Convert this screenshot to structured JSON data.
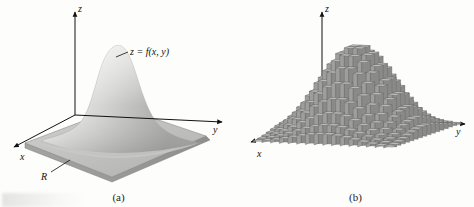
{
  "figure": {
    "background": "#fdfdfc",
    "ink": "#111111"
  },
  "panels": [
    {
      "id": "a",
      "caption": "(a)",
      "axes": {
        "x_label": "x",
        "y_label": "y",
        "z_label": "z"
      },
      "annotations": {
        "surface_label": "z = f(x, y)",
        "region_label": "R"
      },
      "surface": {
        "kind": "smooth-bell",
        "fill_light": "#f2f2f1",
        "fill_mid": "#c9c9c7",
        "fill_dark": "#a2a2a0"
      },
      "region": {
        "fill_top": "#c2c2c0",
        "fill_side": "#9d9d9b",
        "edge": "#7d7d7b"
      }
    },
    {
      "id": "b",
      "caption": "(b)",
      "axes": {
        "x_label": "x",
        "y_label": "y",
        "z_label": "z"
      },
      "surface": {
        "kind": "riemann-prisms",
        "column_face": "#9e9e9c",
        "column_side": "#8a8a88",
        "column_top": "#c4c4c2",
        "edge": "#5f5f5d"
      }
    }
  ],
  "chart_data": {
    "type": "surface",
    "title": "",
    "xlabel": "x",
    "ylabel": "y",
    "zlabel": "z",
    "description_a": "Smooth surface z = f(x, y) over rectangular region R in the xy-plane",
    "description_b": "Riemann sum approximation of the same surface by rectangular prisms over a grid partition of R",
    "function": "bell / gaussian-like peak centered on region R",
    "grid_nx": 16,
    "grid_ny": 16,
    "peak_height": 1.0,
    "x_range": [
      -2,
      2
    ],
    "y_range": [
      -2,
      2
    ],
    "z_range": [
      0,
      1
    ],
    "legend": [],
    "grid": false
  }
}
